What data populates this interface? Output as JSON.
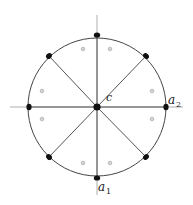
{
  "diagram": {
    "type": "circle partitioned into 8 sectors",
    "center": {
      "x": 97,
      "y": 107,
      "label": "c"
    },
    "radius": 69,
    "axes": {
      "horizontal": {
        "x1": 10,
        "x2": 183,
        "y": 107
      },
      "vertical": {
        "x": 97,
        "y1": 15,
        "y2": 195
      }
    },
    "labels": {
      "center": "c",
      "a2_main": "a",
      "a2_sub": "2",
      "a1_main": "a",
      "a1_sub": "1"
    },
    "vertices": [
      {
        "name": "top",
        "x": 97,
        "y": 35
      },
      {
        "name": "top-right",
        "x": 146,
        "y": 56
      },
      {
        "name": "right",
        "x": 166,
        "y": 107
      },
      {
        "name": "bottom-right",
        "x": 146,
        "y": 157
      },
      {
        "name": "bottom",
        "x": 97,
        "y": 178
      },
      {
        "name": "bottom-left",
        "x": 49,
        "y": 157
      },
      {
        "name": "left",
        "x": 29,
        "y": 107
      },
      {
        "name": "top-left",
        "x": 49,
        "y": 56
      }
    ],
    "sector_markers": [
      {
        "x": 83,
        "y": 49
      },
      {
        "x": 110,
        "y": 49
      },
      {
        "x": 152,
        "y": 91
      },
      {
        "x": 152,
        "y": 119
      },
      {
        "x": 110,
        "y": 163
      },
      {
        "x": 83,
        "y": 163
      },
      {
        "x": 42,
        "y": 119
      },
      {
        "x": 42,
        "y": 91
      }
    ],
    "colors": {
      "circle": "#444444",
      "spokes": "#555555",
      "axes": "#9a9a9a",
      "points": "#111111",
      "markers": "#8a8a8a"
    }
  }
}
